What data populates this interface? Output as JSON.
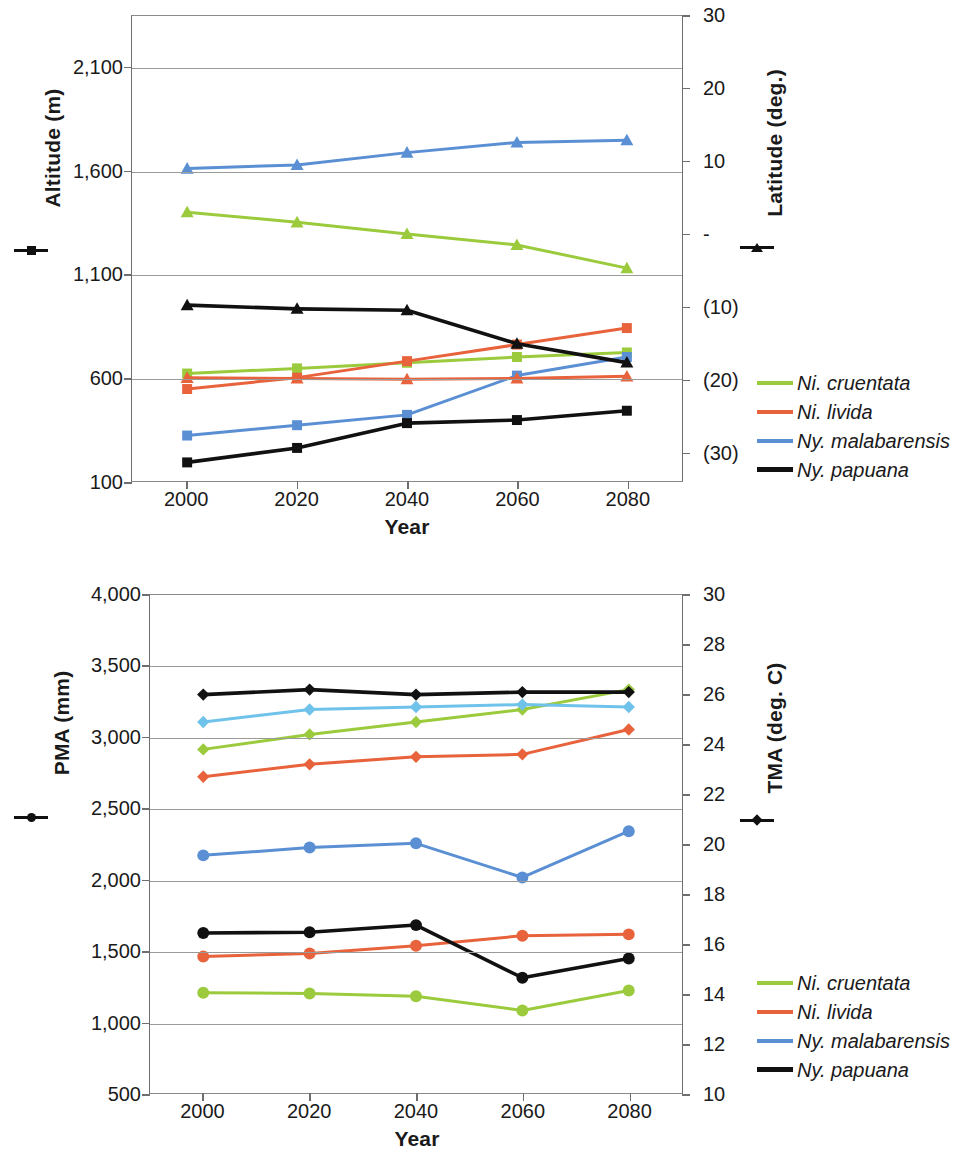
{
  "figure": {
    "panels": [
      {
        "id": "top",
        "left_axis_title": "Altitude (m)",
        "right_axis_title": "Latitude (deg.)",
        "x_axis_title": "Year",
        "left_marker_icon": "square-marker",
        "right_marker_icon": "triangle-marker",
        "left_ticks": [
          "2,100",
          "1,600",
          "1,100",
          "600",
          "100"
        ],
        "right_ticks": [
          "30",
          "20",
          "10",
          "-",
          "(10)",
          "(20)",
          "(30)"
        ],
        "x_ticks": [
          "2000",
          "2020",
          "2040",
          "2060",
          "2080"
        ],
        "legend": [
          {
            "label": "Ni. cruentata",
            "color": "#9BCB3C"
          },
          {
            "label": "Ni. livida",
            "color": "#E8623C"
          },
          {
            "label": "Ny. malabarensis",
            "color": "#5B8FD4"
          },
          {
            "label": "Ny. papuana",
            "color": "#111111"
          }
        ]
      },
      {
        "id": "bottom",
        "left_axis_title": "PMA (mm)",
        "right_axis_title": "TMA (deg. C)",
        "x_axis_title": "Year",
        "left_marker_icon": "circle-marker",
        "right_marker_icon": "diamond-marker",
        "left_ticks": [
          "4,000",
          "3,500",
          "3,000",
          "2,500",
          "2,000",
          "1,500",
          "1,000",
          "500"
        ],
        "right_ticks": [
          "30",
          "28",
          "26",
          "24",
          "22",
          "20",
          "18",
          "16",
          "14",
          "12",
          "10"
        ],
        "x_ticks": [
          "2000",
          "2020",
          "2040",
          "2060",
          "2080"
        ],
        "legend": [
          {
            "label": "Ni. cruentata",
            "color": "#9BCB3C"
          },
          {
            "label": "Ni. livida",
            "color": "#E8623C"
          },
          {
            "label": "Ny. malabarensis",
            "color": "#5B8FD4"
          },
          {
            "label": "Ny. papuana",
            "color": "#111111"
          }
        ]
      }
    ]
  },
  "chart_data": [
    {
      "type": "line",
      "id": "altitude-latitude",
      "title": "",
      "xlabel": "Year",
      "ylabel": "Altitude (m)",
      "y2label": "Latitude (deg.)",
      "x": [
        2000,
        2020,
        2040,
        2060,
        2080
      ],
      "xlim": [
        1990,
        2090
      ],
      "ylim": [
        100,
        2350
      ],
      "y2lim": [
        -34,
        30
      ],
      "yticks": [
        100,
        600,
        1100,
        1600,
        2100
      ],
      "y2ticks": [
        -30,
        -20,
        -10,
        0,
        10,
        20,
        30
      ],
      "grid": true,
      "legend_position": "right",
      "series": [
        {
          "name": "Ni. cruentata",
          "axis": "left",
          "variable": "Altitude (m)",
          "marker": "square",
          "color": "#9BCB3C",
          "values": [
            620,
            645,
            672,
            700,
            722
          ]
        },
        {
          "name": "Ni. livida",
          "axis": "left",
          "variable": "Altitude (m)",
          "marker": "square",
          "color": "#E8623C",
          "values": [
            545,
            600,
            680,
            760,
            840
          ]
        },
        {
          "name": "Ny. malabarensis",
          "axis": "left",
          "variable": "Altitude (m)",
          "marker": "square",
          "color": "#5B8FD4",
          "values": [
            320,
            370,
            420,
            610,
            700
          ]
        },
        {
          "name": "Ny. papuana",
          "axis": "left",
          "variable": "Altitude (m)",
          "marker": "square",
          "color": "#111111",
          "values": [
            190,
            260,
            380,
            395,
            440
          ]
        },
        {
          "name": "Ni. cruentata",
          "axis": "right",
          "variable": "Latitude (deg.)",
          "marker": "triangle",
          "color": "#9BCB3C",
          "values": [
            3.0,
            1.6,
            0.0,
            -1.5,
            -4.7
          ]
        },
        {
          "name": "Ni. livida",
          "axis": "right",
          "variable": "Latitude (deg.)",
          "marker": "triangle",
          "color": "#E8623C",
          "values": [
            -19.8,
            -19.9,
            -20.0,
            -19.9,
            -19.6
          ]
        },
        {
          "name": "Ny. malabarensis",
          "axis": "right",
          "variable": "Latitude (deg.)",
          "marker": "triangle",
          "color": "#5B8FD4",
          "values": [
            9.0,
            9.5,
            11.2,
            12.6,
            12.9
          ]
        },
        {
          "name": "Ny. papuana",
          "axis": "right",
          "variable": "Latitude (deg.)",
          "marker": "triangle",
          "color": "#111111",
          "values": [
            -9.8,
            -10.3,
            -10.5,
            -15.1,
            -17.7
          ]
        }
      ]
    },
    {
      "type": "line",
      "id": "pma-tma",
      "title": "",
      "xlabel": "Year",
      "ylabel": "PMA (mm)",
      "y2label": "TMA (deg. C)",
      "x": [
        2000,
        2020,
        2040,
        2060,
        2080
      ],
      "xlim": [
        1990,
        2090
      ],
      "ylim": [
        500,
        4000
      ],
      "y2lim": [
        10,
        30
      ],
      "yticks": [
        500,
        1000,
        1500,
        2000,
        2500,
        3000,
        3500,
        4000
      ],
      "y2ticks": [
        10,
        12,
        14,
        16,
        18,
        20,
        22,
        24,
        26,
        28,
        30
      ],
      "grid": true,
      "legend_position": "right",
      "series": [
        {
          "name": "Ni. cruentata",
          "axis": "left",
          "variable": "PMA (mm)",
          "marker": "circle",
          "color": "#9BCB3C",
          "values": [
            1205,
            1200,
            1180,
            1080,
            1220
          ]
        },
        {
          "name": "Ni. livida",
          "axis": "left",
          "variable": "PMA (mm)",
          "marker": "circle",
          "color": "#E8623C",
          "values": [
            1460,
            1480,
            1535,
            1605,
            1615
          ]
        },
        {
          "name": "Ny. malabarensis",
          "axis": "left",
          "variable": "PMA (mm)",
          "marker": "circle",
          "color": "#5B8FD4",
          "values": [
            2170,
            2225,
            2255,
            2015,
            2340
          ]
        },
        {
          "name": "Ny. papuana",
          "axis": "left",
          "variable": "PMA (mm)",
          "marker": "circle",
          "color": "#111111",
          "values": [
            1625,
            1630,
            1680,
            1310,
            1445
          ]
        },
        {
          "name": "Ni. cruentata",
          "axis": "right",
          "variable": "TMA (deg. C)",
          "marker": "diamond",
          "color": "#9BCB3C",
          "values": [
            23.8,
            24.4,
            24.9,
            25.4,
            26.2
          ]
        },
        {
          "name": "Ni. livida",
          "axis": "right",
          "variable": "TMA (deg. C)",
          "marker": "diamond",
          "color": "#E8623C",
          "values": [
            22.7,
            23.2,
            23.5,
            23.6,
            24.6
          ]
        },
        {
          "name": "Ny. malabarensis",
          "axis": "right",
          "variable": "TMA (deg. C)",
          "marker": "diamond",
          "color": "#6FC2EA",
          "values": [
            24.9,
            25.4,
            25.5,
            25.6,
            25.5
          ]
        },
        {
          "name": "Ny. papuana",
          "axis": "right",
          "variable": "TMA (deg. C)",
          "marker": "diamond",
          "color": "#111111",
          "values": [
            26.0,
            26.2,
            26.0,
            26.1,
            26.1
          ]
        }
      ]
    }
  ]
}
